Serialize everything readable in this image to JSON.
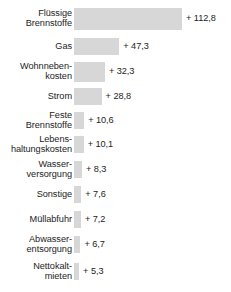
{
  "chart_data": {
    "type": "bar",
    "orientation": "horizontal",
    "title": "",
    "subtitle": "",
    "xlabel": "",
    "ylabel": "",
    "grid": false,
    "legend": null,
    "xlim": [
      0,
      112.8
    ],
    "value_prefix": "+ ",
    "decimal_separator": ",",
    "categories": [
      "Flüssige\nBrennstoffe",
      "Gas",
      "Wohnneben-\nkosten",
      "Strom",
      "Feste\nBrennstoffe",
      "Lebens-\nhaltungskosten",
      "Wasser-\nversorgung",
      "Sonstige",
      "Müllabfuhr",
      "Abwasser-\nentsorgung",
      "Nettokalt-\nmieten"
    ],
    "values": [
      112.8,
      47.3,
      32.3,
      28.8,
      10.6,
      10.1,
      8.3,
      7.6,
      7.2,
      6.7,
      5.3
    ],
    "value_labels": [
      "+ 112,8",
      "+ 47,3",
      "+ 32,3",
      "+ 28,8",
      "+ 10,6",
      "+ 10,1",
      "+ 8,3",
      "+ 7,6",
      "+ 7,2",
      "+ 6,7",
      "+ 5,3"
    ],
    "colors": {
      "bar": "#d7d7d7",
      "text": "#1c1c1c",
      "background": "#ffffff"
    }
  },
  "rows": [
    {
      "label": "Flüssige\nBrennstoffe",
      "value_label": "+ 112,8",
      "value": 112.8
    },
    {
      "label": "Gas",
      "value_label": "+ 47,3",
      "value": 47.3
    },
    {
      "label": "Wohnneben-\nkosten",
      "value_label": "+ 32,3",
      "value": 32.3
    },
    {
      "label": "Strom",
      "value_label": "+ 28,8",
      "value": 28.8
    },
    {
      "label": "Feste\nBrennstoffe",
      "value_label": "+ 10,6",
      "value": 10.6
    },
    {
      "label": "Lebens-\nhaltungskosten",
      "value_label": "+ 10,1",
      "value": 10.1
    },
    {
      "label": "Wasser-\nversorgung",
      "value_label": "+ 8,3",
      "value": 8.3
    },
    {
      "label": "Sonstige",
      "value_label": "+ 7,6",
      "value": 7.6
    },
    {
      "label": "Müllabfuhr",
      "value_label": "+ 7,2",
      "value": 7.2
    },
    {
      "label": "Abwasser-\nentsorgung",
      "value_label": "+ 6,7",
      "value": 6.7
    },
    {
      "label": "Nettokalt-\nmieten",
      "value_label": "+ 5,3",
      "value": 5.3
    }
  ],
  "layout": {
    "bar_origin_x": 76,
    "bar_max_width": 108,
    "row_tops": [
      8,
      38,
      62,
      88,
      112,
      136,
      161,
      186,
      211,
      236,
      263
    ],
    "row_heights": [
      22,
      17,
      20,
      17,
      17,
      17,
      17,
      17,
      17,
      17,
      17
    ]
  }
}
